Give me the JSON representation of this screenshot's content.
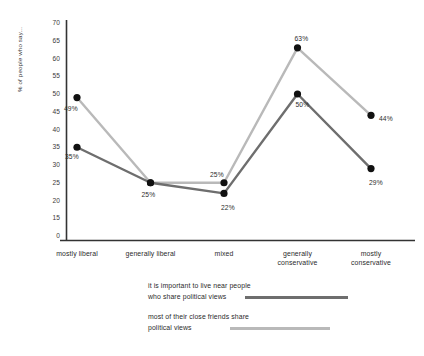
{
  "chart_data": {
    "type": "line",
    "title": "",
    "xlabel": "",
    "ylabel": "% of people who say...",
    "categories": [
      "mostly liberal",
      "generally liberal",
      "mixed",
      "generally conservative",
      "mostly conservative"
    ],
    "category_lines": [
      [
        "mostly liberal"
      ],
      [
        "generally liberal"
      ],
      [
        "mixed"
      ],
      [
        "generally",
        "conservative"
      ],
      [
        "mostly",
        "conservative"
      ]
    ],
    "series": [
      {
        "name": "it is important to live near people who share political views",
        "color": "#6e6e6e",
        "values": [
          35,
          25,
          22,
          50,
          29
        ],
        "labels": [
          "35%",
          "25%",
          "22%",
          "50%",
          "29%"
        ]
      },
      {
        "name": "most of their close friends share political views",
        "color": "#b9b9b9",
        "values": [
          49,
          25,
          25,
          63,
          44
        ],
        "labels": [
          "49%",
          "25%",
          "25%",
          "63%",
          "44%"
        ]
      }
    ],
    "ylim": [
      0,
      70
    ],
    "yticks": [
      70,
      65,
      60,
      55,
      50,
      45,
      40,
      35,
      30,
      25,
      20,
      15,
      0
    ],
    "ytick_labels": [
      "70",
      "65",
      "60",
      "55",
      "50",
      "45",
      "40",
      "35",
      "30",
      "25",
      "20",
      "15",
      "0"
    ],
    "grid": false,
    "legend_position": "bottom-center",
    "marker": "filled-circle",
    "marker_color": "#111111"
  },
  "legend": {
    "entries": [
      {
        "label": "it is important to live near people\nwho share political views",
        "color": "#6e6e6e"
      },
      {
        "label": "most of their close friends share\npolitical views",
        "color": "#b9b9b9"
      }
    ]
  },
  "axes": {
    "y_title": "% of people who say..."
  }
}
